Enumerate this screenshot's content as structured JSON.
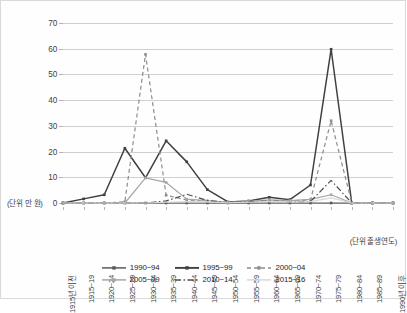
{
  "chart_data": {
    "type": "line",
    "title": "",
    "xlabel": "(단위 출생연도)",
    "ylabel": "(단위 만 원)",
    "ylim": [
      0,
      70
    ],
    "ytick_step": 10,
    "yticks": [
      0,
      10,
      20,
      30,
      40,
      50,
      60,
      70
    ],
    "grid": true,
    "legend_position": "bottom",
    "categories": [
      "1915년 이전",
      "1915~19",
      "1920~24",
      "1925~29",
      "1930~34",
      "1935~39",
      "1940~44",
      "1945~49",
      "1950~54",
      "1955~59",
      "1960~64",
      "1965~69",
      "1970~74",
      "1975~79",
      "1980~84",
      "1985~89",
      "1990년 이후"
    ],
    "series": [
      {
        "name": "1990~94",
        "color": "#595959",
        "style": "solid",
        "marker": "square",
        "values": [
          0,
          0,
          0,
          0,
          0,
          0,
          0,
          0,
          0,
          0,
          0,
          0,
          0,
          0,
          0,
          0,
          0
        ]
      },
      {
        "name": "1995~99",
        "color": "#404040",
        "style": "solid",
        "marker": "square",
        "values": [
          0,
          1.6,
          3.2,
          21.3,
          9.8,
          24.2,
          16.0,
          5.2,
          0.4,
          0.8,
          2.2,
          1.3,
          7.0,
          59.8,
          0,
          0,
          0
        ]
      },
      {
        "name": "2000~04",
        "color": "#8c8c8c",
        "style": "dashed",
        "marker": "square",
        "values": [
          0,
          0,
          0,
          0.5,
          57.8,
          3.0,
          1.2,
          0.6,
          0.2,
          0.5,
          1.0,
          0.8,
          1.2,
          32.0,
          0,
          0,
          0
        ]
      },
      {
        "name": "2005~09",
        "color": "#a6a6a6",
        "style": "solid",
        "marker": "square",
        "values": [
          0,
          0,
          0,
          0,
          9.8,
          8.0,
          1.5,
          0.9,
          0.3,
          0.6,
          1.2,
          0.9,
          1.4,
          3.2,
          0,
          0,
          0
        ]
      },
      {
        "name": "2010~14",
        "color": "#4d4d4d",
        "style": "dashdot",
        "marker": "none",
        "values": [
          0,
          0,
          0,
          0,
          0,
          0.8,
          3.4,
          1.0,
          0.2,
          0.4,
          0.8,
          0.5,
          0.6,
          8.8,
          0,
          0,
          0
        ]
      },
      {
        "name": "2015~16",
        "color": "#d9d9d9",
        "style": "solid",
        "marker": "none",
        "values": [
          0,
          0,
          0,
          0,
          0,
          0.3,
          0.5,
          0.4,
          0.1,
          0.3,
          0.6,
          0.4,
          0.5,
          2.0,
          0,
          0,
          0
        ]
      }
    ]
  },
  "axes": {
    "y_unit_label": "(단위 만 원)",
    "x_unit_label": "(단위 출생연도)"
  }
}
